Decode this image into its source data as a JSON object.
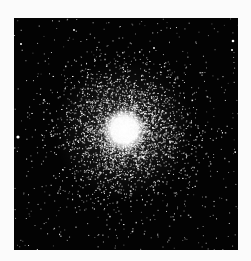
{
  "image": {
    "subject": "globular star cluster",
    "background_color": "#030303",
    "page_background": "#fbfbfb",
    "star_color": "#ffffff",
    "frame": {
      "left": 14,
      "top": 18,
      "width": 224,
      "height": 232
    },
    "core": {
      "cx": 110,
      "cy": 112,
      "core_radius": 22,
      "halo_radius": 70
    },
    "bright_field_stars": [
      {
        "x": 4,
        "y": 119,
        "r": 1.6
      },
      {
        "x": 219,
        "y": 23,
        "r": 1.3
      },
      {
        "x": 7,
        "y": 26,
        "r": 1.0
      },
      {
        "x": 218,
        "y": 32,
        "r": 1.0
      },
      {
        "x": 60,
        "y": 12,
        "r": 0.9
      },
      {
        "x": 140,
        "y": 30,
        "r": 0.9
      }
    ]
  }
}
